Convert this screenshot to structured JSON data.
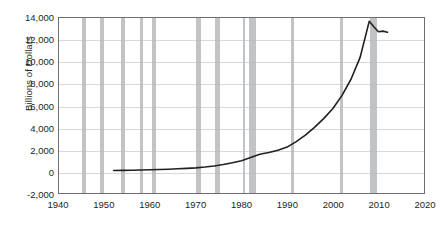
{
  "chart_data": {
    "type": "line",
    "title": "",
    "subtitle": "",
    "xlabel": "",
    "ylabel": "Billions of Dollars",
    "xlim": [
      1940,
      2020
    ],
    "ylim": [
      -2000,
      14000
    ],
    "grid": true,
    "legend_position": "none",
    "x_ticks": [
      1940,
      1950,
      1960,
      1970,
      1980,
      1990,
      2000,
      2010,
      2020
    ],
    "x_tick_labels": [
      "1940",
      "1950",
      "1960",
      "1970",
      "1980",
      "1990",
      "2000",
      "2010",
      "2020"
    ],
    "y_ticks": [
      -2000,
      0,
      2000,
      4000,
      6000,
      8000,
      10000,
      12000,
      14000
    ],
    "y_tick_labels": [
      "-2,000",
      "0",
      "2,000",
      "4,000",
      "6,000",
      "8,000",
      "10,000",
      "12,000",
      "14,000"
    ],
    "series": [
      {
        "name": "Billions of Dollars",
        "color": "#231f20",
        "x": [
          1952,
          1954,
          1956,
          1958,
          1960,
          1962,
          1964,
          1966,
          1968,
          1970,
          1972,
          1974,
          1976,
          1978,
          1980,
          1982,
          1984,
          1986,
          1988,
          1990,
          1992,
          1994,
          1996,
          1998,
          2000,
          2002,
          2004,
          2006,
          2008,
          2009,
          2010,
          2011,
          2012
        ],
        "values": [
          60,
          70,
          85,
          100,
          120,
          145,
          175,
          210,
          250,
          300,
          370,
          470,
          600,
          760,
          950,
          1250,
          1550,
          1700,
          1900,
          2200,
          2700,
          3300,
          4000,
          4800,
          5700,
          6900,
          8400,
          10400,
          13700,
          13200,
          12750,
          12800,
          12700
        ]
      }
    ],
    "bands": {
      "name": "recessions",
      "color": "#b7b9bb",
      "intervals": [
        [
          1945.1,
          1945.8
        ],
        [
          1948.9,
          1949.8
        ],
        [
          1953.5,
          1954.4
        ],
        [
          1957.6,
          1958.3
        ],
        [
          1960.3,
          1961.1
        ],
        [
          1969.9,
          1970.9
        ],
        [
          1973.9,
          1975.2
        ],
        [
          1980.1,
          1980.6
        ],
        [
          1981.5,
          1982.9
        ],
        [
          1990.6,
          1991.2
        ],
        [
          2001.2,
          2001.9
        ],
        [
          2007.9,
          2009.4
        ]
      ]
    }
  }
}
